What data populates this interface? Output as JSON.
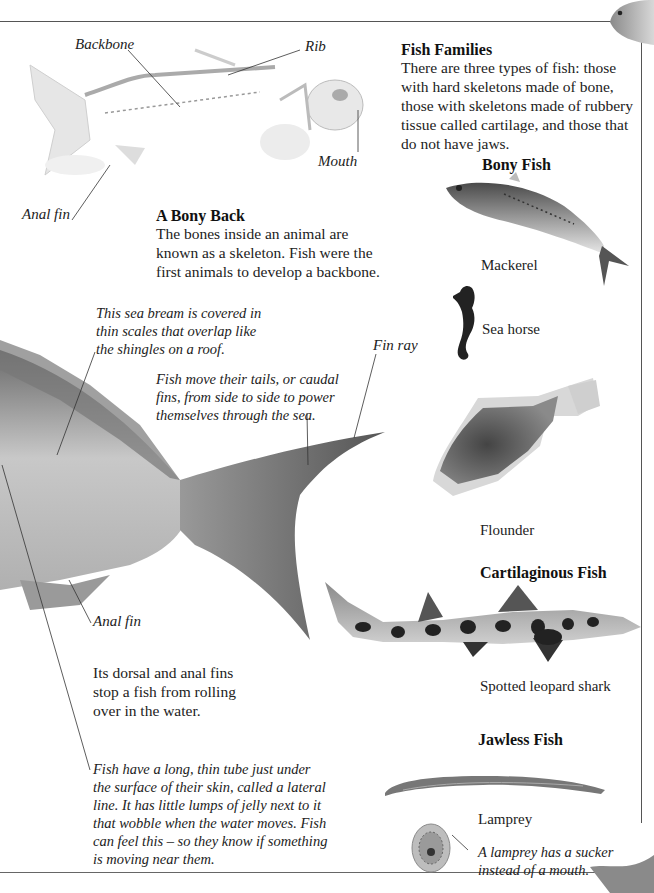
{
  "skeleton_section": {
    "labels": {
      "backbone": "Backbone",
      "rib": "Rib",
      "mouth": "Mouth",
      "anal_fin": "Anal fin"
    },
    "heading": "A Bony Back",
    "body": "The bones inside an animal are known as a skeleton. Fish were the first animals to develop a backbone."
  },
  "fish_families": {
    "heading": "Fish Families",
    "body": "There are three types of fish: those with hard skeletons made of bone, those with skeletons made of rubbery tissue called cartilage, and those that do not have jaws.",
    "groups": [
      {
        "title": "Bony Fish",
        "species": [
          "Mackerel",
          "Sea horse",
          "Flounder"
        ]
      },
      {
        "title": "Cartilaginous Fish",
        "species": [
          "Spotted leopard shark"
        ]
      },
      {
        "title": "Jawless Fish",
        "species": [
          "Lamprey"
        ]
      }
    ],
    "lamprey_caption": "A lamprey has a sucker instead of a mouth."
  },
  "sea_bream_section": {
    "scales_caption": "This sea bream is covered in thin scales that overlap like the shingles on a roof.",
    "tail_caption": "Fish move their tails, or caudal fins, from side to side to power themselves through the sea.",
    "fin_ray_label": "Fin ray",
    "anal_fin_label": "Anal fin",
    "dorsal_text": "Its dorsal and anal fins stop a fish from rolling over in the water.",
    "lateral_line_caption": "Fish have a long, thin tube just under the surface of their skin, called a lateral line. It has little lumps of jelly next to it that wobble when the water moves. Fish can feel this – so they know if something is moving near them."
  }
}
